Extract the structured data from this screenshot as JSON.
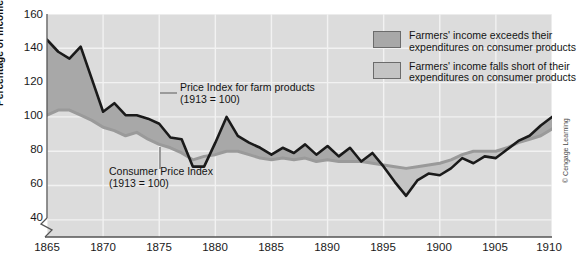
{
  "chart_data": {
    "type": "area",
    "title": "",
    "xlabel": "",
    "ylabel": "Percentage of Income",
    "xlim": [
      1865,
      1910
    ],
    "ylim": [
      30,
      160
    ],
    "grid": true,
    "y_ticks": [
      160,
      140,
      120,
      100,
      80,
      60,
      40
    ],
    "x_ticks": [
      1865,
      1870,
      1875,
      1880,
      1885,
      1890,
      1895,
      1900,
      1905,
      1910
    ],
    "axis_break": true,
    "legend_position": "top-right",
    "x": [
      1865,
      1866,
      1867,
      1868,
      1869,
      1870,
      1871,
      1872,
      1873,
      1874,
      1875,
      1876,
      1877,
      1878,
      1879,
      1880,
      1881,
      1882,
      1883,
      1884,
      1885,
      1886,
      1887,
      1888,
      1889,
      1890,
      1891,
      1892,
      1893,
      1894,
      1895,
      1896,
      1897,
      1898,
      1899,
      1900,
      1901,
      1902,
      1903,
      1904,
      1905,
      1906,
      1907,
      1908,
      1909,
      1910
    ],
    "series": [
      {
        "name": "Price Index for farm products (1913 = 100)",
        "color": "#1a1a1a",
        "values": [
          145,
          138,
          134,
          141,
          122,
          103,
          108,
          101,
          101,
          99,
          96,
          88,
          87,
          71,
          71,
          85,
          100,
          89,
          85,
          82,
          78,
          82,
          79,
          84,
          78,
          83,
          77,
          82,
          74,
          79,
          71,
          62,
          54,
          63,
          67,
          66,
          70,
          76,
          73,
          77,
          76,
          81,
          86,
          89,
          95,
          100
        ]
      },
      {
        "name": "Consumer Price Index (1913 = 100)",
        "color": "#9a9a9a",
        "values": [
          101,
          104,
          104,
          101,
          98,
          94,
          92,
          89,
          91,
          87,
          84,
          82,
          79,
          75,
          77,
          78,
          80,
          80,
          78,
          76,
          75,
          76,
          75,
          76,
          74,
          75,
          74,
          74,
          74,
          73,
          72,
          71,
          70,
          71,
          72,
          73,
          75,
          78,
          80,
          80,
          80,
          82,
          85,
          87,
          89,
          93
        ]
      }
    ],
    "fill_regions": [
      {
        "label": "Farmers' income exceeds their expenditures on consumer products",
        "color": "#a8a8a8",
        "condition": "farm_above_cpi"
      },
      {
        "label": "Farmers' income falls short of their expenditures on consumer products",
        "color": "#c4c4c4",
        "condition": "farm_below_cpi"
      }
    ]
  },
  "axis": {
    "y_title": "Percentage of Income",
    "y_ticks": [
      "160",
      "140",
      "120",
      "100",
      "80",
      "60",
      "40"
    ],
    "x_ticks": [
      "1865",
      "1870",
      "1875",
      "1880",
      "1885",
      "1890",
      "1895",
      "1900",
      "1905",
      "1910"
    ]
  },
  "legend": {
    "items": [
      {
        "swatch_color": "#a8a8a8",
        "line1": "Farmers' income exceeds their",
        "line2": "expenditures on consumer products"
      },
      {
        "swatch_color": "#c4c4c4",
        "line1": "Farmers' income falls short of their",
        "line2": "expenditures on consumer products"
      }
    ]
  },
  "annotations": {
    "farm": "Price Index for farm products\n(1913 = 100)",
    "cpi": "Consumer Price Index\n(1913 = 100)"
  },
  "credit": "© Cengage Learning",
  "colors": {
    "plot_background": "#dcdcdc",
    "gridline": "#f2f2f2",
    "farm_line": "#1a1a1a",
    "cpi_line": "#9a9a9a",
    "fill_exceeds": "#a8a8a8",
    "fill_short": "#c4c4c4",
    "axis": "#555555"
  }
}
